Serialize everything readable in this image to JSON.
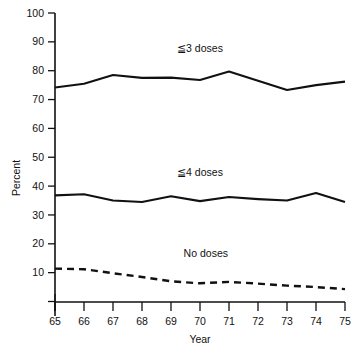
{
  "chart_data": {
    "type": "line",
    "title": "",
    "xlabel": "Year",
    "ylabel": "Percent",
    "x": [
      65,
      66,
      67,
      68,
      69,
      70,
      71,
      72,
      73,
      74,
      75
    ],
    "xtick_labels": [
      "65",
      "66",
      "67",
      "68",
      "69",
      "70",
      "71",
      "72",
      "73",
      "74",
      "75"
    ],
    "ytick_labels": [
      "10",
      "20",
      "30",
      "40",
      "50",
      "60",
      "70",
      "80",
      "90",
      "100"
    ],
    "yticks": [
      10,
      20,
      30,
      40,
      50,
      60,
      70,
      80,
      90,
      100
    ],
    "xlim": [
      65,
      75
    ],
    "ylim": [
      0,
      100
    ],
    "grid": false,
    "legend": "inline-annotations",
    "series": [
      {
        "name": "≦3 doses",
        "style": "solid",
        "label_x": 70.0,
        "label_y": 86.5,
        "values": [
          74.2,
          75.5,
          78.5,
          77.5,
          77.6,
          76.8,
          79.7,
          76.5,
          73.3,
          75.0,
          76.2
        ]
      },
      {
        "name": "≦4 doses",
        "style": "solid",
        "label_x": 70.0,
        "label_y": 43.5,
        "values": [
          36.8,
          37.2,
          35.0,
          34.5,
          36.5,
          34.8,
          36.2,
          35.5,
          35.0,
          37.6,
          34.5
        ]
      },
      {
        "name": "No doses",
        "style": "dashed",
        "label_x": 70.2,
        "label_y": 15.5,
        "values": [
          11.4,
          11.2,
          9.8,
          8.5,
          7.0,
          6.3,
          6.8,
          6.2,
          5.5,
          5.0,
          4.3
        ]
      }
    ],
    "colors": {
      "axis": "#111111",
      "line": "#111111",
      "background": "#ffffff"
    }
  }
}
